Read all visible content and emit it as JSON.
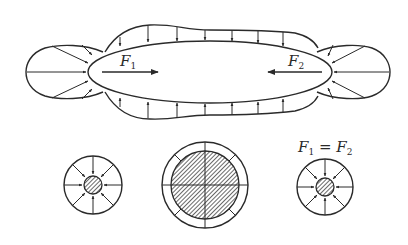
{
  "diagram": {
    "labels": {
      "force_left": {
        "main": "F",
        "sub": "1"
      },
      "force_right": {
        "main": "F",
        "sub": "2"
      },
      "equation": {
        "lhs_main": "F",
        "lhs_sub": "1",
        "eq": " = ",
        "rhs_main": "F",
        "rhs_sub": "2"
      }
    },
    "elements": [
      "elongated body with pressure distribution envelope",
      "left end pressure lobe with radial arrows",
      "right end pressure lobe with radial arrows",
      "force arrow F1 pointing right",
      "force arrow F2 pointing left",
      "small cross-section left with radial arrows and hatched core",
      "large cross-section center with hatched core",
      "small cross-section right with radial arrows and hatched core"
    ],
    "colors": {
      "ink": "#2a2a2a",
      "background": "#ffffff"
    }
  }
}
